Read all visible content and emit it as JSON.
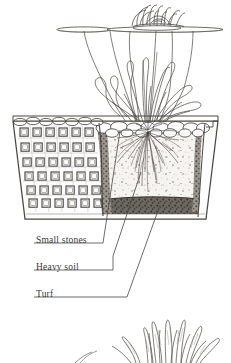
{
  "figure": {
    "kind": "cross-section-illustration",
    "background_color": "#ffffff",
    "ink_color": "#3a3a3a",
    "width": 231,
    "height": 363
  },
  "labels": [
    {
      "id": "small-stones",
      "text": "Small stones"
    },
    {
      "id": "heavy-soil",
      "text": "Heavy soil"
    },
    {
      "id": "turf",
      "text": "Turf"
    }
  ],
  "scene": {
    "water_surface": {
      "name": "water-surface-line",
      "y": 30
    },
    "lily_flower": {
      "name": "water-lily-flower",
      "petal_count": 16
    },
    "lily_pads": {
      "name": "lily-pads",
      "count": 3
    },
    "foliage": {
      "name": "submerged-foliage",
      "leaf_count": 14
    },
    "basket": {
      "name": "mesh-planting-basket",
      "mesh_columns": 6,
      "mesh_rows": 6,
      "top_y": 122,
      "bottom_y": 218
    },
    "layers": [
      {
        "id": "small-stones",
        "name": "stone-mulch-layer",
        "color": "#fdfdfd"
      },
      {
        "id": "heavy-soil",
        "name": "soil-fill-layer",
        "color": "#f4f2ee"
      },
      {
        "id": "turf",
        "name": "turf-lining-layer",
        "color": "#4a4741"
      }
    ],
    "roots": {
      "name": "fibrous-root-mass",
      "strand_count": 34
    },
    "bottom_plant": {
      "name": "sword-leaf-plant-vignette",
      "leaf_count": 13
    }
  }
}
